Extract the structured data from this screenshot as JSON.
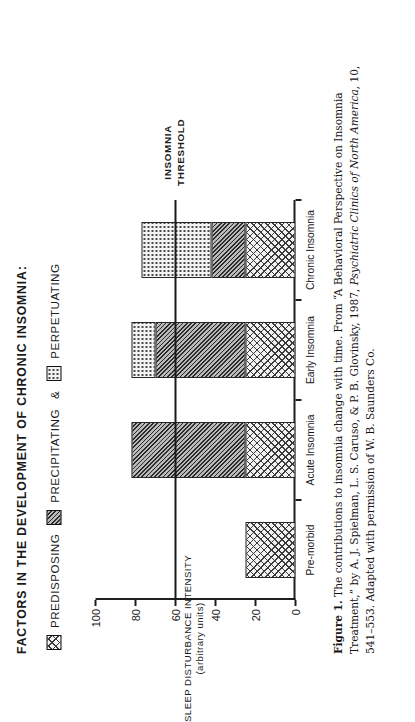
{
  "title": "FACTORS IN THE DEVELOPMENT OF CHRONIC INSOMNIA:",
  "legend": {
    "items": [
      {
        "label": "PREDISPOSING",
        "pattern": "cross-hatch"
      },
      {
        "label": "PRECIPITATING",
        "pattern": "dense-diagonal"
      },
      {
        "label": "PERPETUATING",
        "pattern": "fine-dots"
      }
    ],
    "conjunction": "&"
  },
  "annotation": {
    "line1": "INSOMNIA",
    "line2": "THRESHOLD",
    "value": 60
  },
  "caption": {
    "figure_number": "Figure 1.",
    "text_1": "The contributions to insomnia change with time. From “A Behavioral Perspective on Insomnia Treatment,” by A. J. Spielman, L. S. Caruso, & P. B. Glovinsky, 1987, ",
    "journal": "Psychiatric Clinics of North America",
    "text_2": ", 10, 541–553. Adapted with permission of W. B. Saunders Co."
  },
  "chart_data": {
    "type": "bar",
    "title": "FACTORS IN THE DEVELOPMENT OF CHRONIC INSOMNIA:",
    "xlabel": "",
    "ylabel": "SLEEP DISTURBANCE INTENSITY (arbitrary units)",
    "ylabel_line1": "SLEEP DISTURBANCE INTENSITY",
    "ylabel_line2": "(arbitrary units)",
    "ylim": [
      0,
      100
    ],
    "yticks": [
      0,
      20,
      40,
      60,
      80,
      100
    ],
    "grid": false,
    "stacked": true,
    "legend_position": "top",
    "categories": [
      "Pre-morbid",
      "Acute Insomnia",
      "Early Insomnia",
      "Chronic Insomnia"
    ],
    "series": [
      {
        "name": "PREDISPOSING",
        "values": [
          25,
          25,
          25,
          25
        ]
      },
      {
        "name": "PRECIPITATING",
        "values": [
          0,
          57,
          45,
          17
        ]
      },
      {
        "name": "PERPETUATING",
        "values": [
          0,
          0,
          12,
          35
        ]
      }
    ],
    "totals": [
      25,
      82,
      82,
      77
    ],
    "annotations": [
      {
        "type": "hline",
        "label": "INSOMNIA THRESHOLD",
        "value": 60
      }
    ]
  }
}
